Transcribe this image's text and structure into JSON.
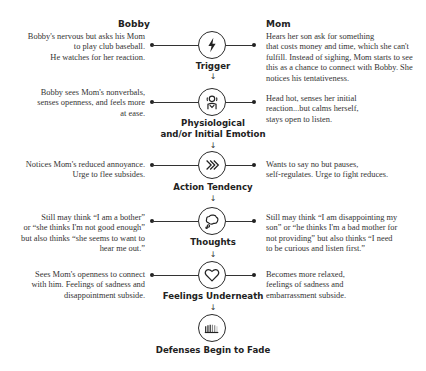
{
  "headers": {
    "left": "Bobby",
    "right": "Mom"
  },
  "steps": [
    {
      "label": "Trigger",
      "icon": "lightning-bolt-icon",
      "bobby": "Bobby's nervous but asks his Mom to play club baseball. He watches for her reaction.",
      "bobby_lines": [
        "Bobby's nervous but asks his Mom",
        "to play club baseball.",
        "He watches for her reaction."
      ],
      "mom_lines": [
        "Hears her son ask for something",
        "that costs money and time, which she can't",
        "fulfill. Instead of sighing, Mom starts to see",
        "this as a chance to connect with Bobby. She",
        "notices his tentativeness."
      ]
    },
    {
      "label": "Physiological and/or Initial Emotion",
      "label_lines": [
        "Physiological",
        "and/or Initial Emotion"
      ],
      "icon": "person-body-icon",
      "bobby_lines": [
        "Bobby sees Mom's nonverbals,",
        "senses openness, and feels more",
        "at ease."
      ],
      "mom_lines": [
        "Head hot, senses her initial",
        "reaction...but calms herself,",
        "stays open to listen."
      ]
    },
    {
      "label": "Action Tendency",
      "icon": "chevrons-right-icon",
      "bobby_lines": [
        "Notices Mom's reduced annoyance.",
        "Urge to flee subsides."
      ],
      "mom_lines": [
        "Wants to say no but pauses,",
        "self-regulates. Urge to fight reduces."
      ]
    },
    {
      "label": "Thoughts",
      "icon": "thought-bubble-icon",
      "bobby_lines": [
        "Still may think “I am a bother”",
        "or “she thinks I'm not good enough”",
        "but also thinks “she seems to want to",
        "hear me out.”"
      ],
      "mom_lines": [
        "Still may think “I am disappointing my",
        "son” or “he thinks I'm a bad mother for",
        "not providing” but also thinks “I need",
        "to be curious and listen first.”"
      ]
    },
    {
      "label": "Feelings Underneath",
      "icon": "heart-icon",
      "bobby_lines": [
        "Sees Mom's openness to connect",
        "with him. Feelings of sadness and",
        "disappointment subside."
      ],
      "mom_lines": [
        "Becomes more relaxed,",
        "feelings of sadness and",
        "embarrassment subside."
      ]
    },
    {
      "label": "Defenses Begin to Fade",
      "icon": "fading-wall-icon"
    }
  ],
  "arrow_glyph": "↓"
}
